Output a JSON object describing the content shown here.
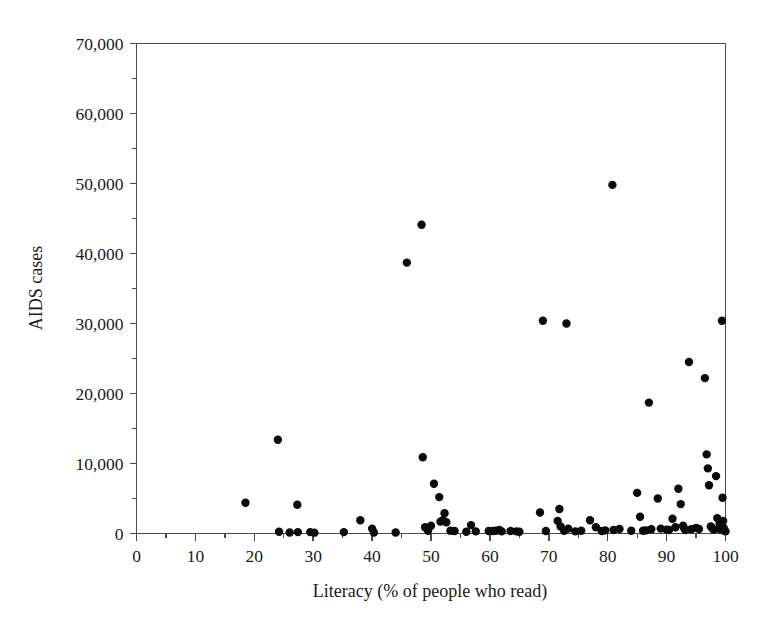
{
  "chart_data": {
    "type": "scatter",
    "title": "",
    "xlabel": "Literacy (% of people who read)",
    "ylabel": "AIDS cases",
    "xlim": [
      0,
      100
    ],
    "ylim": [
      0,
      70000
    ],
    "grid": false,
    "legend": "none",
    "x_ticks": [
      0,
      10,
      20,
      30,
      40,
      50,
      60,
      70,
      80,
      90,
      100
    ],
    "x_tick_labels": [
      "0",
      "10",
      "20",
      "30",
      "40",
      "50",
      "60",
      "70",
      "80",
      "90",
      "100"
    ],
    "x_minor_step": 5,
    "y_ticks": [
      0,
      10000,
      20000,
      30000,
      40000,
      50000,
      60000,
      70000
    ],
    "y_tick_labels": [
      "0",
      "10,000",
      "20,000",
      "30,000",
      "40,000",
      "50,000",
      "60,000",
      "70,000"
    ],
    "y_minor_step": 5000,
    "marker": "filled-circle",
    "marker_color": "#0b0b0b",
    "marker_size_px": 5.2,
    "series": [
      {
        "name": "Countries",
        "points": [
          [
            18.5,
            4400
          ],
          [
            24.0,
            13400
          ],
          [
            24.2,
            250
          ],
          [
            26.0,
            150
          ],
          [
            27.3,
            4100
          ],
          [
            27.4,
            200
          ],
          [
            29.5,
            200
          ],
          [
            30.2,
            120
          ],
          [
            35.2,
            200
          ],
          [
            38.0,
            1900
          ],
          [
            40.0,
            700
          ],
          [
            40.3,
            150
          ],
          [
            44.0,
            150
          ],
          [
            45.9,
            38700
          ],
          [
            48.4,
            44100
          ],
          [
            48.6,
            10900
          ],
          [
            49.0,
            900
          ],
          [
            49.5,
            400
          ],
          [
            50.0,
            1100
          ],
          [
            50.5,
            7100
          ],
          [
            51.4,
            5200
          ],
          [
            51.6,
            1700
          ],
          [
            52.0,
            1900
          ],
          [
            52.3,
            2900
          ],
          [
            52.6,
            1600
          ],
          [
            53.3,
            400
          ],
          [
            54.0,
            350
          ],
          [
            56.0,
            250
          ],
          [
            56.8,
            1200
          ],
          [
            57.6,
            300
          ],
          [
            59.8,
            350
          ],
          [
            60.5,
            350
          ],
          [
            61.0,
            400
          ],
          [
            61.6,
            500
          ],
          [
            62.0,
            300
          ],
          [
            63.5,
            350
          ],
          [
            64.5,
            300
          ],
          [
            65.0,
            250
          ],
          [
            68.5,
            3000
          ],
          [
            69.0,
            30400
          ],
          [
            69.5,
            350
          ],
          [
            71.5,
            1800
          ],
          [
            71.8,
            3500
          ],
          [
            72.0,
            1000
          ],
          [
            72.6,
            400
          ],
          [
            73.0,
            30000
          ],
          [
            73.3,
            700
          ],
          [
            74.5,
            300
          ],
          [
            75.5,
            400
          ],
          [
            77.0,
            1900
          ],
          [
            78.0,
            900
          ],
          [
            79.0,
            350
          ],
          [
            79.6,
            450
          ],
          [
            80.8,
            49800
          ],
          [
            81.0,
            500
          ],
          [
            82.0,
            650
          ],
          [
            84.0,
            400
          ],
          [
            85.0,
            5800
          ],
          [
            85.5,
            2400
          ],
          [
            86.0,
            400
          ],
          [
            86.5,
            450
          ],
          [
            87.0,
            18700
          ],
          [
            87.4,
            600
          ],
          [
            88.5,
            5000
          ],
          [
            89.0,
            700
          ],
          [
            90.0,
            550
          ],
          [
            90.4,
            500
          ],
          [
            91.0,
            2100
          ],
          [
            91.5,
            900
          ],
          [
            92.0,
            6400
          ],
          [
            92.4,
            4200
          ],
          [
            92.8,
            1100
          ],
          [
            93.0,
            700
          ],
          [
            93.2,
            500
          ],
          [
            93.8,
            24500
          ],
          [
            94.2,
            600
          ],
          [
            95.0,
            800
          ],
          [
            95.5,
            650
          ],
          [
            96.5,
            22200
          ],
          [
            96.8,
            11300
          ],
          [
            97.0,
            9300
          ],
          [
            97.2,
            6900
          ],
          [
            97.5,
            1000
          ],
          [
            97.8,
            700
          ],
          [
            98.0,
            550
          ],
          [
            98.4,
            8200
          ],
          [
            98.6,
            2200
          ],
          [
            98.8,
            700
          ],
          [
            99.0,
            1400
          ],
          [
            99.2,
            600
          ],
          [
            99.4,
            30400
          ],
          [
            99.5,
            5100
          ],
          [
            99.6,
            1800
          ],
          [
            99.7,
            800
          ],
          [
            99.8,
            400
          ],
          [
            100.0,
            300
          ]
        ]
      }
    ]
  },
  "colors": {
    "marker": "#0b0b0b",
    "axis": "#4a4a4a",
    "text": "#1a1a1a",
    "background": "#ffffff"
  }
}
